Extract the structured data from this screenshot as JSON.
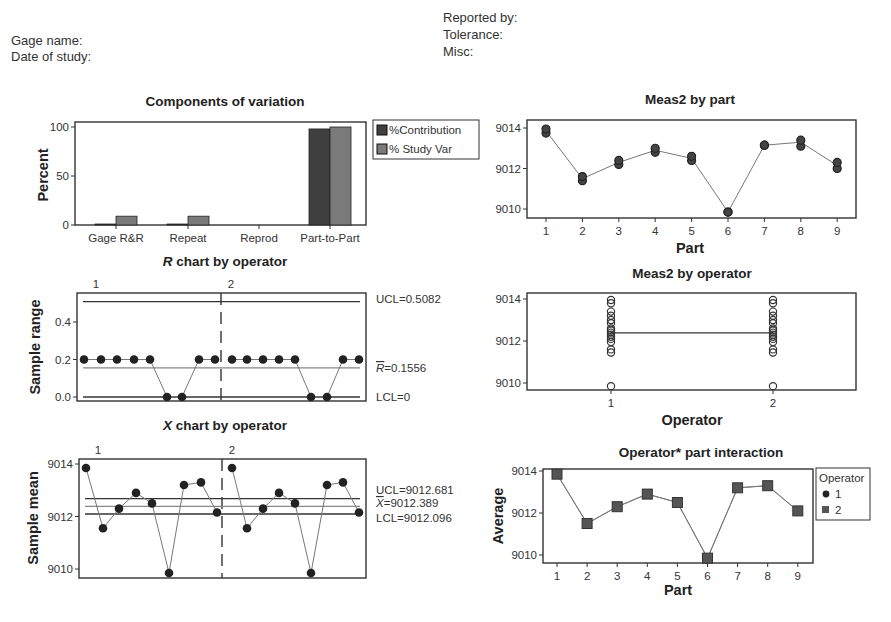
{
  "header": {
    "gage_name_label": "Gage name:",
    "date_label": "Date of study:",
    "reported_by_label": "Reported by:",
    "tolerance_label": "Tolerance:",
    "misc_label": "Misc:"
  },
  "colors": {
    "contribution": "#3f3f3f",
    "study_var": "#7a7a7a",
    "line": "#777777",
    "marker": "#222222",
    "frame": "#333333"
  },
  "chart_data": [
    {
      "id": "components",
      "type": "bar",
      "title": "Components of variation",
      "ylabel": "Percent",
      "xlabel": "",
      "ylim": [
        0,
        100
      ],
      "yticks": [
        0,
        50,
        100
      ],
      "categories": [
        "Gage R&R",
        "Repeat",
        "Reprod",
        "Part-to-Part"
      ],
      "series": [
        {
          "name": "%Contribution",
          "values": [
            1,
            1,
            0,
            98
          ]
        },
        {
          "name": "% Study Var",
          "values": [
            9,
            9,
            0,
            100
          ]
        }
      ],
      "legend": [
        "%Contribution",
        "% Study Var"
      ],
      "legend_position": "right"
    },
    {
      "id": "r_chart",
      "type": "line",
      "title": "R chart by operator",
      "title_italic_prefix": "R",
      "title_rest": " chart by operator",
      "ylabel": "Sample range",
      "ylim": [
        0,
        0.52
      ],
      "yticks": [
        "0.0",
        "0.2",
        "0.4"
      ],
      "operators": [
        "1",
        "2"
      ],
      "series": [
        {
          "name": "1",
          "values": [
            0.2,
            0.2,
            0.2,
            0.2,
            0.2,
            0.0,
            0.0,
            0.2,
            0.2
          ]
        },
        {
          "name": "2",
          "values": [
            0.2,
            0.2,
            0.2,
            0.2,
            0.2,
            0.0,
            0.0,
            0.2,
            0.2
          ]
        }
      ],
      "ucl": 0.5082,
      "center": 0.1556,
      "lcl": 0,
      "labels": {
        "ucl": "UCL=0.5082",
        "center": "=0.1556",
        "center_sym": "R",
        "lcl": "LCL=0"
      }
    },
    {
      "id": "xbar_chart",
      "type": "line",
      "title": "X chart by operator",
      "title_italic_prefix": "X",
      "title_rest": " chart by operator",
      "ylabel": "Sample mean",
      "ylim": [
        9009.8,
        9014.1
      ],
      "yticks": [
        "9010",
        "9012",
        "9014"
      ],
      "operators": [
        "1",
        "2"
      ],
      "series": [
        {
          "name": "1",
          "values": [
            9013.85,
            9011.55,
            9012.3,
            9012.9,
            9012.5,
            9009.85,
            9013.2,
            9013.3,
            9012.15
          ]
        },
        {
          "name": "2",
          "values": [
            9013.85,
            9011.55,
            9012.3,
            9012.9,
            9012.5,
            9009.85,
            9013.2,
            9013.3,
            9012.15
          ]
        }
      ],
      "ucl": 9012.681,
      "center": 9012.389,
      "lcl": 9012.096,
      "labels": {
        "ucl": "UCL=9012.681",
        "center": "=9012.389",
        "center_sym": "X",
        "lcl": "LCL=9012.096"
      }
    },
    {
      "id": "meas_by_part",
      "type": "scatter",
      "title": "Meas2 by part",
      "xlabel": "Part",
      "ylabel": "",
      "ylim": [
        9009.7,
        9014.3
      ],
      "yticks": [
        "9010",
        "9012",
        "9014"
      ],
      "categories": [
        "1",
        "2",
        "3",
        "4",
        "5",
        "6",
        "7",
        "8",
        "9"
      ],
      "means": [
        9013.85,
        9011.5,
        9012.3,
        9012.9,
        9012.5,
        9009.85,
        9013.15,
        9013.3,
        9012.15
      ],
      "points": [
        [
          9013.75,
          9013.95
        ],
        [
          9011.4,
          9011.6
        ],
        [
          9012.2,
          9012.4
        ],
        [
          9012.8,
          9013.0
        ],
        [
          9012.4,
          9012.6
        ],
        [
          9009.85,
          9009.85
        ],
        [
          9013.15,
          9013.15
        ],
        [
          9013.1,
          9013.4
        ],
        [
          9012.0,
          9012.3
        ]
      ]
    },
    {
      "id": "meas_by_operator",
      "type": "scatter",
      "title": "Meas2 by operator",
      "xlabel": "Operator",
      "ylabel": "",
      "ylim": [
        9009.7,
        9014.3
      ],
      "yticks": [
        "9010",
        "9012",
        "9014"
      ],
      "categories": [
        "1",
        "2"
      ],
      "means": [
        9012.39,
        9012.39
      ],
      "points": [
        9013.95,
        9013.8,
        9013.4,
        9013.2,
        9013.0,
        9012.85,
        9012.6,
        9012.5,
        9012.4,
        9012.3,
        9012.2,
        9012.1,
        9011.95,
        9011.6,
        9011.45,
        9009.85
      ]
    },
    {
      "id": "interaction",
      "type": "line",
      "title": "Operator* part interaction",
      "xlabel": "Part",
      "ylabel": "Average",
      "ylim": [
        9009.7,
        9014.1
      ],
      "yticks": [
        "9010",
        "9012",
        "9014"
      ],
      "categories": [
        "1",
        "2",
        "3",
        "4",
        "5",
        "6",
        "7",
        "8",
        "9"
      ],
      "series": [
        {
          "name": "1",
          "marker": "circle",
          "values": [
            9013.85,
            9011.5,
            9012.3,
            9012.9,
            9012.5,
            9009.85,
            9013.2,
            9013.3,
            9012.1
          ]
        },
        {
          "name": "2",
          "marker": "square",
          "values": [
            9013.85,
            9011.5,
            9012.3,
            9012.9,
            9012.5,
            9009.85,
            9013.2,
            9013.3,
            9012.1
          ]
        }
      ],
      "legend_title": "Operator",
      "legend": [
        "1",
        "2"
      ],
      "legend_position": "right"
    }
  ]
}
